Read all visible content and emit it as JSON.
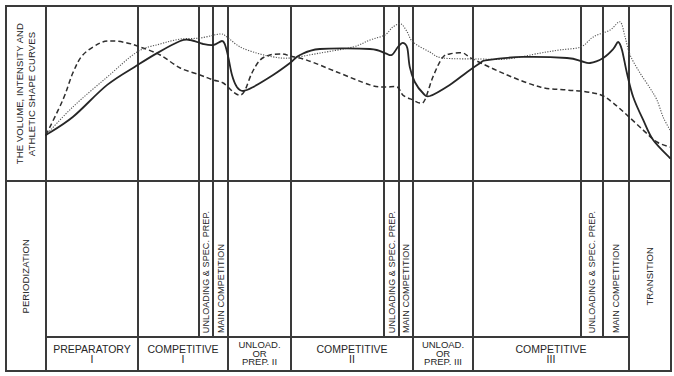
{
  "figure": {
    "curves_label": {
      "line1": "THE VOLUME, INTENSITY AND",
      "line2": "ATHLETIC SHAPE CURVES"
    },
    "periodization_label": "PERIODIZATION",
    "transition_label": "TRANSITION",
    "subphases": [
      {
        "unloading": "UNLOADING & SPEC. PREP.",
        "main": "MAIN COMPETITION"
      },
      {
        "unloading": "UNLOADING & SPEC. PREP.",
        "main": "MAIN COMPETITION"
      },
      {
        "unloading": "UNLOADING & SPEC. PREP.",
        "main": "MAIN COMPETITION"
      }
    ],
    "phases": [
      {
        "line1": "PREPARATORY",
        "line2": "I"
      },
      {
        "line1": "COMPETITIVE",
        "line2": "I"
      },
      {
        "line1": "UNLOAD.",
        "line2": "OR",
        "line3": "PREP. II"
      },
      {
        "line1": "COMPETITIVE",
        "line2": "II"
      },
      {
        "line1": "UNLOAD.",
        "line2": "OR",
        "line3": "PREP. III"
      },
      {
        "line1": "COMPETITIVE",
        "line2": "III"
      }
    ]
  },
  "chart_data": {
    "type": "line",
    "title": "",
    "xlabel": "",
    "ylabel": "THE VOLUME, INTENSITY AND ATHLETIC SHAPE CURVES",
    "x_units": "percent of annual plan (estimated, no axis shown)",
    "y_units": "relative level 0-100 (estimated, no axis shown)",
    "xlim": [
      0,
      100
    ],
    "ylim": [
      0,
      100
    ],
    "grid": false,
    "legend": "none",
    "phase_boundaries_x": [
      14.7,
      24.5,
      26.8,
      29.2,
      39.3,
      54.2,
      56.6,
      58.8,
      68.4,
      85.7,
      89.3,
      93.4
    ],
    "phase_labels": [
      "PREPARATORY I",
      "COMPETITIVE I",
      "UNLOAD. OR PREP. II",
      "COMPETITIVE II",
      "UNLOAD. OR PREP. III",
      "COMPETITIVE III",
      "TRANSITION"
    ],
    "series": [
      {
        "name": "dashed curve",
        "style": "dashed",
        "points": [
          [
            0,
            26.3
          ],
          [
            2.7,
            46.3
          ],
          [
            4.3,
            61.7
          ],
          [
            5.9,
            72
          ],
          [
            8.7,
            78.9
          ],
          [
            10.7,
            80
          ],
          [
            13,
            78.9
          ],
          [
            15.1,
            76.6
          ],
          [
            18.3,
            72
          ],
          [
            21.5,
            64.6
          ],
          [
            24.7,
            60.6
          ],
          [
            26.8,
            57.7
          ],
          [
            28.4,
            56
          ],
          [
            30,
            50.9
          ],
          [
            31.1,
            49.1
          ],
          [
            31.9,
            52
          ],
          [
            33,
            61.7
          ],
          [
            34.3,
            69.1
          ],
          [
            35.9,
            72
          ],
          [
            38,
            72.6
          ],
          [
            39.1,
            71.4
          ],
          [
            41.8,
            69.1
          ],
          [
            46.6,
            62.3
          ],
          [
            51.9,
            54.9
          ],
          [
            54.3,
            53.7
          ],
          [
            56.3,
            53.7
          ],
          [
            57.2,
            49.1
          ],
          [
            58.8,
            46.3
          ],
          [
            59.9,
            44.6
          ],
          [
            60.7,
            46.3
          ],
          [
            62,
            59.4
          ],
          [
            63.5,
            70.3
          ],
          [
            64.7,
            72.6
          ],
          [
            66.8,
            73.1
          ],
          [
            68.4,
            69.7
          ],
          [
            73.9,
            60.6
          ],
          [
            79.2,
            53.7
          ],
          [
            83.5,
            52
          ],
          [
            85.7,
            51.4
          ],
          [
            87.7,
            50.3
          ],
          [
            89.3,
            48.6
          ],
          [
            90.9,
            44.6
          ],
          [
            93.1,
            37.7
          ],
          [
            95.7,
            29.1
          ],
          [
            97.9,
            22.3
          ],
          [
            100,
            19.4
          ]
        ]
      },
      {
        "name": "dotted curve",
        "style": "dotted",
        "points": [
          [
            0,
            26.3
          ],
          [
            4.3,
            42.3
          ],
          [
            9.8,
            59.4
          ],
          [
            14.6,
            73.7
          ],
          [
            18.3,
            78.3
          ],
          [
            21.5,
            81.1
          ],
          [
            24.7,
            81.7
          ],
          [
            27.9,
            84
          ],
          [
            29,
            82.3
          ],
          [
            31.1,
            76.6
          ],
          [
            33.8,
            73.1
          ],
          [
            36.4,
            70.9
          ],
          [
            39.1,
            70.3
          ],
          [
            43.9,
            73.1
          ],
          [
            49.2,
            76.6
          ],
          [
            51.9,
            80.6
          ],
          [
            54.3,
            83.4
          ],
          [
            55.6,
            88
          ],
          [
            56.9,
            89.7
          ],
          [
            57.9,
            85.1
          ],
          [
            58.8,
            79.4
          ],
          [
            61.5,
            73.7
          ],
          [
            63.6,
            70.3
          ],
          [
            69.6,
            69.7
          ],
          [
            73.9,
            69.7
          ],
          [
            79.2,
            73.1
          ],
          [
            82.4,
            74.9
          ],
          [
            85.7,
            76.6
          ],
          [
            87.7,
            82.3
          ],
          [
            90.4,
            86.3
          ],
          [
            92,
            90.9
          ],
          [
            92.8,
            82.3
          ],
          [
            93.6,
            72
          ],
          [
            95.2,
            61.7
          ],
          [
            96.8,
            53.1
          ],
          [
            97.9,
            46.3
          ],
          [
            98.9,
            36.6
          ],
          [
            100,
            29.1
          ]
        ]
      },
      {
        "name": "solid curve",
        "style": "solid",
        "points": [
          [
            0,
            26.3
          ],
          [
            4.3,
            36.6
          ],
          [
            9.8,
            54.9
          ],
          [
            14.7,
            66.3
          ],
          [
            17.8,
            73.1
          ],
          [
            21.5,
            80
          ],
          [
            23.1,
            80.6
          ],
          [
            25.2,
            78.3
          ],
          [
            26.8,
            77.7
          ],
          [
            28.2,
            80
          ],
          [
            28.7,
            77.7
          ],
          [
            29.2,
            70.9
          ],
          [
            29.8,
            60.6
          ],
          [
            30.6,
            53.7
          ],
          [
            31.6,
            51.4
          ],
          [
            33.2,
            53.7
          ],
          [
            36.4,
            60.6
          ],
          [
            39.1,
            67.4
          ],
          [
            40.7,
            72
          ],
          [
            43.9,
            75.4
          ],
          [
            51.9,
            75.4
          ],
          [
            54.3,
            73.1
          ],
          [
            55.4,
            72
          ],
          [
            56.4,
            76.6
          ],
          [
            57.2,
            78.9
          ],
          [
            57.9,
            76
          ],
          [
            58.3,
            65.1
          ],
          [
            59.1,
            56.6
          ],
          [
            60.4,
            50.3
          ],
          [
            61.5,
            48.6
          ],
          [
            64.7,
            54.9
          ],
          [
            67.5,
            62.3
          ],
          [
            69.6,
            67.4
          ],
          [
            70.7,
            69.1
          ],
          [
            76.4,
            70.9
          ],
          [
            83.5,
            70.3
          ],
          [
            85.7,
            68.6
          ],
          [
            87.2,
            67.4
          ],
          [
            89.3,
            70.3
          ],
          [
            90.9,
            75.4
          ],
          [
            91.7,
            79.4
          ],
          [
            92.3,
            74.9
          ],
          [
            93.1,
            61.7
          ],
          [
            94.1,
            48
          ],
          [
            95.7,
            34.9
          ],
          [
            97.3,
            23.4
          ],
          [
            100,
            13.1
          ]
        ]
      }
    ]
  }
}
